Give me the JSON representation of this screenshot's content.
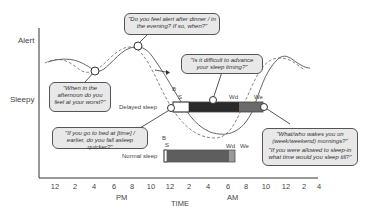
{
  "yaxis": {
    "top_label": "Alert",
    "bottom_label": "Sleepy"
  },
  "xaxis": {
    "ticks": [
      "12",
      "2",
      "4",
      "6",
      "8",
      "10",
      "12",
      "2",
      "4",
      "6",
      "8",
      "10",
      "12",
      "2",
      "4"
    ],
    "pm_label": "PM",
    "am_label": "AM",
    "title": "TIME"
  },
  "callouts": {
    "evening_alert": "\"Do you feel alert after dinner / in the evening? If so, when?\"",
    "afternoon_worst": "\"When in the afternoon do you feel at your worst?\"",
    "advance_sleep": "\"Is it difficult to advance your sleep timing?\"",
    "earlier_bed": "\"If you go to bed at [time] / earlier, do you fall asleep quicker?\"",
    "wake_1": "\"What/who wakes you on (week/weekend) mornings?\"",
    "wake_2": "\"If you were allowed to sleep-in what time would you sleep till?\""
  },
  "bars": {
    "delayed": {
      "label": "Delayed sleep",
      "b": "B",
      "s": "S",
      "wd": "Wd",
      "we": "We"
    },
    "normal": {
      "label": "Normal sleep",
      "b": "B",
      "s": "S",
      "wd": "Wd",
      "we": "We"
    }
  },
  "colors": {
    "delayed_dark": "#2a2a2a",
    "normal_gray": "#5e5e5e",
    "weekend_gray": "#8a8a8a",
    "callout_bg": "#e8e8e8"
  }
}
